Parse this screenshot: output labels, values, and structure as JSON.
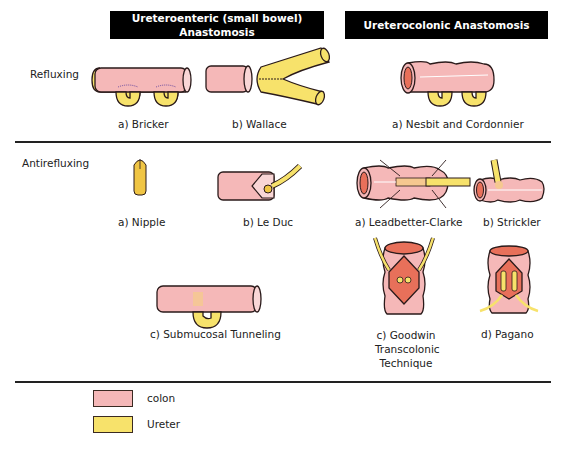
{
  "headers": {
    "ureteroenteric": "Ureteroenteric (small bowel) Anastomosis",
    "ureteroenteric_line1": "Ureteroenteric (small bowel)",
    "ureteroenteric_line2": "Anastomosis",
    "ureterocolonic": "Ureterocolonic Anastomosis"
  },
  "rows": {
    "refluxing": "Refluxing",
    "antirefluxing": "Antirefluxing"
  },
  "refluxing_items": {
    "bricker": "a) Bricker",
    "wallace": "b) Wallace",
    "nesbit": "a) Nesbit and Cordonnier"
  },
  "antirefluxing_items": {
    "nipple": "a) Nipple",
    "leduc": "b) Le Duc",
    "submucosal": "c) Submucosal Tunneling",
    "leadbetter": "a) Leadbetter-Clarke",
    "strickler": "b) Strickler",
    "goodwin": "c) Goodwin Transcolonic Technique",
    "pagano": "d) Pagano"
  },
  "legend": [
    {
      "label": "colon",
      "color": "#f5b8b8"
    },
    {
      "label": "Ureter",
      "color": "#f7e26b"
    }
  ],
  "colors": {
    "colon": "#f5b8b8",
    "colon_lumen": "#e8705a",
    "ureter": "#f7e26b",
    "outline": "#2a1a1a",
    "header_bg": "#000000"
  }
}
